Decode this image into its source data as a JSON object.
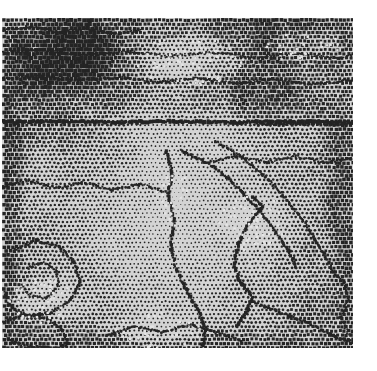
{
  "image": {
    "kind": "halftone-dither-bitmap",
    "description": "Monochrome error-diffusion / halftone dithered grayscale photograph of a mottled textured surface",
    "canvas_width": 377,
    "canvas_height": 371,
    "background_color": "#ffffff",
    "content_left": 2,
    "content_top": 18,
    "content_right": 353,
    "content_bottom": 348,
    "ink_color": "#141414",
    "paper_color": "#d8d8d8",
    "highlight_color": "#e9e9e9",
    "shadow_color": "#5a5a5a",
    "dot_pitch": 4.2,
    "dot_radius_min": 0.35,
    "dot_radius_max": 2.35,
    "grid_angle_deg": 0,
    "noise_amount": 0.13,
    "edge_vignette": 0.16,
    "tone_field": {
      "description": "Coarse luminance control lattice sampled across the content area; 0 = white paper, 1 = solid ink. Bilinearly interpolated to drive halftone dot size.",
      "cols": 13,
      "rows": 13,
      "values": [
        [
          0.62,
          0.58,
          0.66,
          0.7,
          0.64,
          0.55,
          0.5,
          0.58,
          0.66,
          0.7,
          0.68,
          0.64,
          0.6
        ],
        [
          0.66,
          0.6,
          0.68,
          0.72,
          0.66,
          0.52,
          0.44,
          0.52,
          0.62,
          0.68,
          0.66,
          0.62,
          0.58
        ],
        [
          0.7,
          0.64,
          0.7,
          0.72,
          0.62,
          0.46,
          0.38,
          0.46,
          0.56,
          0.62,
          0.6,
          0.58,
          0.56
        ],
        [
          0.68,
          0.62,
          0.64,
          0.64,
          0.54,
          0.42,
          0.36,
          0.42,
          0.5,
          0.56,
          0.56,
          0.54,
          0.54
        ],
        [
          0.64,
          0.56,
          0.56,
          0.54,
          0.46,
          0.38,
          0.34,
          0.38,
          0.44,
          0.5,
          0.52,
          0.52,
          0.52
        ],
        [
          0.58,
          0.5,
          0.48,
          0.46,
          0.4,
          0.34,
          0.32,
          0.34,
          0.4,
          0.46,
          0.48,
          0.5,
          0.52
        ],
        [
          0.54,
          0.46,
          0.42,
          0.4,
          0.36,
          0.32,
          0.3,
          0.32,
          0.36,
          0.42,
          0.46,
          0.48,
          0.52
        ],
        [
          0.52,
          0.44,
          0.4,
          0.36,
          0.33,
          0.3,
          0.28,
          0.3,
          0.34,
          0.4,
          0.44,
          0.48,
          0.52
        ],
        [
          0.52,
          0.44,
          0.4,
          0.36,
          0.32,
          0.3,
          0.28,
          0.3,
          0.34,
          0.4,
          0.44,
          0.48,
          0.54
        ],
        [
          0.54,
          0.46,
          0.42,
          0.38,
          0.34,
          0.31,
          0.29,
          0.31,
          0.35,
          0.41,
          0.46,
          0.5,
          0.56
        ],
        [
          0.58,
          0.5,
          0.44,
          0.4,
          0.36,
          0.33,
          0.31,
          0.33,
          0.38,
          0.44,
          0.48,
          0.52,
          0.58
        ],
        [
          0.62,
          0.54,
          0.48,
          0.44,
          0.4,
          0.36,
          0.34,
          0.36,
          0.41,
          0.47,
          0.51,
          0.55,
          0.6
        ],
        [
          0.66,
          0.58,
          0.52,
          0.48,
          0.44,
          0.4,
          0.38,
          0.4,
          0.45,
          0.5,
          0.54,
          0.58,
          0.62
        ]
      ]
    },
    "contour_chains": [
      {
        "name": "horizontal-rule-upper",
        "weight": 1.9,
        "points": [
          [
            2,
            122
          ],
          [
            60,
            121
          ],
          [
            120,
            122
          ],
          [
            180,
            121
          ],
          [
            240,
            122
          ],
          [
            300,
            121
          ],
          [
            353,
            122
          ]
        ]
      },
      {
        "name": "upper-mesh-band-lower-edge",
        "weight": 1.1,
        "points": [
          [
            2,
            78
          ],
          [
            40,
            76
          ],
          [
            78,
            80
          ],
          [
            120,
            77
          ],
          [
            158,
            82
          ],
          [
            196,
            78
          ],
          [
            234,
            83
          ],
          [
            272,
            79
          ],
          [
            310,
            84
          ],
          [
            353,
            80
          ]
        ]
      },
      {
        "name": "upper-mesh-band-mid",
        "weight": 0.9,
        "points": [
          [
            2,
            52
          ],
          [
            44,
            50
          ],
          [
            86,
            55
          ],
          [
            128,
            51
          ],
          [
            170,
            56
          ],
          [
            212,
            52
          ],
          [
            254,
            57
          ],
          [
            296,
            53
          ],
          [
            338,
            58
          ],
          [
            353,
            55
          ]
        ]
      },
      {
        "name": "ridge-diagonal-ne",
        "weight": 1.4,
        "points": [
          [
            180,
            150
          ],
          [
            206,
            162
          ],
          [
            228,
            178
          ],
          [
            246,
            196
          ],
          [
            262,
            214
          ],
          [
            276,
            232
          ],
          [
            288,
            250
          ],
          [
            296,
            266
          ]
        ]
      },
      {
        "name": "ridge-diagonal-ne-b",
        "weight": 1.2,
        "points": [
          [
            214,
            140
          ],
          [
            240,
            156
          ],
          [
            262,
            174
          ],
          [
            282,
            194
          ],
          [
            298,
            214
          ],
          [
            312,
            234
          ],
          [
            324,
            254
          ],
          [
            334,
            274
          ]
        ]
      },
      {
        "name": "plate-edge-center",
        "weight": 1.6,
        "points": [
          [
            252,
            196
          ],
          [
            262,
            206
          ],
          [
            248,
            224
          ],
          [
            238,
            244
          ],
          [
            234,
            264
          ],
          [
            240,
            282
          ],
          [
            252,
            296
          ],
          [
            246,
            312
          ],
          [
            236,
            326
          ]
        ]
      },
      {
        "name": "vertical-spine-center",
        "weight": 1.5,
        "points": [
          [
            166,
            150
          ],
          [
            172,
            172
          ],
          [
            168,
            196
          ],
          [
            174,
            220
          ],
          [
            170,
            244
          ],
          [
            176,
            268
          ],
          [
            186,
            290
          ],
          [
            198,
            310
          ],
          [
            206,
            330
          ],
          [
            202,
            348
          ]
        ]
      },
      {
        "name": "left-lobe-outline",
        "weight": 1.3,
        "points": [
          [
            14,
            250
          ],
          [
            36,
            240
          ],
          [
            58,
            246
          ],
          [
            74,
            262
          ],
          [
            80,
            282
          ],
          [
            70,
            300
          ],
          [
            52,
            312
          ],
          [
            30,
            316
          ],
          [
            12,
            308
          ],
          [
            4,
            292
          ]
        ]
      },
      {
        "name": "left-lobe-inner",
        "weight": 1.0,
        "points": [
          [
            26,
            268
          ],
          [
            42,
            262
          ],
          [
            56,
            270
          ],
          [
            58,
            286
          ],
          [
            46,
            298
          ],
          [
            30,
            296
          ],
          [
            22,
            284
          ]
        ]
      },
      {
        "name": "lower-left-blob",
        "weight": 1.2,
        "points": [
          [
            4,
            322
          ],
          [
            24,
            314
          ],
          [
            46,
            318
          ],
          [
            62,
            330
          ],
          [
            68,
            344
          ],
          [
            54,
            348
          ],
          [
            28,
            346
          ],
          [
            8,
            340
          ]
        ]
      },
      {
        "name": "mid-left-sweep",
        "weight": 1.1,
        "points": [
          [
            2,
            186
          ],
          [
            28,
            180
          ],
          [
            56,
            188
          ],
          [
            84,
            182
          ],
          [
            112,
            190
          ],
          [
            140,
            184
          ],
          [
            166,
            192
          ]
        ]
      },
      {
        "name": "mid-right-sweep",
        "weight": 1.0,
        "points": [
          [
            206,
            162
          ],
          [
            236,
            156
          ],
          [
            266,
            162
          ],
          [
            296,
            156
          ],
          [
            326,
            162
          ],
          [
            353,
            158
          ]
        ]
      },
      {
        "name": "lower-diagonal-right",
        "weight": 1.3,
        "points": [
          [
            250,
            300
          ],
          [
            278,
            312
          ],
          [
            306,
            322
          ],
          [
            330,
            334
          ],
          [
            353,
            342
          ]
        ]
      },
      {
        "name": "lower-center-arc",
        "weight": 1.2,
        "points": [
          [
            106,
            336
          ],
          [
            134,
            326
          ],
          [
            162,
            332
          ],
          [
            190,
            324
          ],
          [
            216,
            332
          ],
          [
            240,
            340
          ]
        ]
      },
      {
        "name": "right-edge-hook",
        "weight": 1.1,
        "points": [
          [
            330,
            268
          ],
          [
            344,
            282
          ],
          [
            348,
            300
          ],
          [
            340,
            318
          ],
          [
            348,
            334
          ]
        ]
      },
      {
        "name": "upper-left-speckle-edge",
        "weight": 1.0,
        "points": [
          [
            2,
            30
          ],
          [
            30,
            26
          ],
          [
            58,
            32
          ],
          [
            86,
            28
          ],
          [
            114,
            34
          ],
          [
            142,
            29
          ]
        ]
      },
      {
        "name": "horizontal-rule-right-short",
        "weight": 1.3,
        "points": [
          [
            258,
            124
          ],
          [
            292,
            123
          ],
          [
            326,
            124
          ],
          [
            353,
            123
          ]
        ]
      }
    ],
    "light_patches": [
      {
        "name": "upper-center-highlight",
        "cx": 190,
        "cy": 60,
        "rx": 54,
        "ry": 26,
        "strength": 0.2
      },
      {
        "name": "center-plate-highlight",
        "cx": 252,
        "cy": 222,
        "rx": 34,
        "ry": 30,
        "strength": 0.22
      },
      {
        "name": "center-vertical-highlight",
        "cx": 172,
        "cy": 196,
        "rx": 16,
        "ry": 34,
        "strength": 0.18
      },
      {
        "name": "lower-left-highlight",
        "cx": 44,
        "cy": 300,
        "rx": 36,
        "ry": 24,
        "strength": 0.24
      },
      {
        "name": "lower-center-highlight",
        "cx": 160,
        "cy": 330,
        "rx": 46,
        "ry": 18,
        "strength": 0.18
      },
      {
        "name": "upper-right-highlight",
        "cx": 306,
        "cy": 44,
        "rx": 40,
        "ry": 20,
        "strength": 0.14
      }
    ],
    "dark_patches": [
      {
        "name": "upper-left-mesh-dense",
        "cx": 60,
        "cy": 56,
        "rx": 62,
        "ry": 44,
        "strength": 0.22
      },
      {
        "name": "upper-band-dense",
        "cx": 210,
        "cy": 96,
        "rx": 140,
        "ry": 26,
        "strength": 0.16
      },
      {
        "name": "right-edge-dense",
        "cx": 344,
        "cy": 200,
        "rx": 22,
        "ry": 120,
        "strength": 0.14
      },
      {
        "name": "left-edge-dense",
        "cx": 8,
        "cy": 210,
        "rx": 18,
        "ry": 130,
        "strength": 0.16
      },
      {
        "name": "bottom-edge-dense",
        "cx": 180,
        "cy": 344,
        "rx": 150,
        "ry": 16,
        "strength": 0.14
      }
    ]
  }
}
